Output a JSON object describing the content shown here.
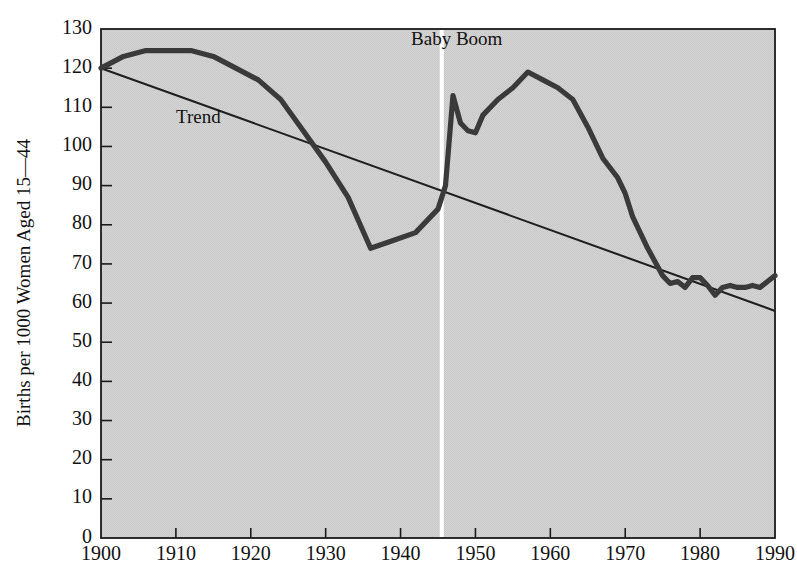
{
  "chart_data": {
    "type": "line",
    "title": "",
    "xlabel": "",
    "ylabel": "Births per 1000 Women Aged 15—44",
    "xlim": [
      1900,
      1990
    ],
    "ylim": [
      0,
      130
    ],
    "ytick_step": 10,
    "xtick_step": 10,
    "grid": false,
    "legend_position": "none",
    "xticks": [
      "1900",
      "1910",
      "1920",
      "1930",
      "1940",
      "1950",
      "1960",
      "1970",
      "1980",
      "1990"
    ],
    "yticks": [
      "0",
      "10",
      "20",
      "30",
      "40",
      "50",
      "60",
      "70",
      "80",
      "90",
      "100",
      "110",
      "120",
      "130"
    ],
    "annotations": [
      {
        "name": "trend-label",
        "text": "Trend",
        "x": 1913,
        "y": 106
      },
      {
        "name": "baby-boom-label",
        "text": "Baby Boom",
        "x": 1947.5,
        "y": 126
      }
    ],
    "marker_lines": [
      {
        "name": "baby-boom-start-divider",
        "x": 1945.5,
        "color": "#ffffff"
      }
    ],
    "series": [
      {
        "name": "Fertility rate",
        "color": "#3a3a3a",
        "x": [
          1900,
          1903,
          1906,
          1909,
          1912,
          1915,
          1918,
          1921,
          1924,
          1927,
          1930,
          1933,
          1936,
          1939,
          1942,
          1945,
          1946,
          1947,
          1948,
          1949,
          1950,
          1951,
          1953,
          1955,
          1957,
          1959,
          1961,
          1963,
          1965,
          1967,
          1969,
          1970,
          1971,
          1973,
          1975,
          1976,
          1977,
          1978,
          1979,
          1980,
          1981,
          1982,
          1983,
          1984,
          1985,
          1986,
          1987,
          1988,
          1989,
          1990
        ],
        "values": [
          120,
          123,
          124.5,
          124.5,
          124.5,
          123,
          120,
          117,
          112,
          104,
          96,
          87,
          74,
          76,
          78,
          84,
          90,
          113,
          106,
          104,
          103.5,
          108,
          112,
          115,
          119,
          117,
          115,
          112,
          105,
          97,
          92,
          88,
          82,
          74,
          67,
          65,
          65.5,
          64,
          66.5,
          66.5,
          64.5,
          62,
          64,
          64.5,
          64,
          64,
          64.5,
          64,
          65.5,
          67
        ]
      },
      {
        "name": "Trend",
        "color": "#1f1f1f",
        "x": [
          1900,
          1990
        ],
        "values": [
          120,
          58
        ]
      }
    ]
  },
  "style": {
    "plot_background": "#d2d2d2",
    "page_background": "#ffffff",
    "axis_color": "#1a1a1a"
  }
}
